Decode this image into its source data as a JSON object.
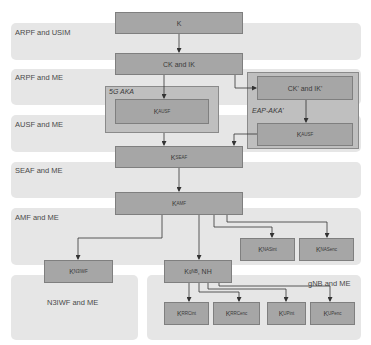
{
  "bands": [
    {
      "id": "arpf-usim",
      "label": "ARPF and USIM"
    },
    {
      "id": "arpf-me",
      "label": "ARPF and ME"
    },
    {
      "id": "ausf-me",
      "label": "AUSF and ME"
    },
    {
      "id": "seaf-me",
      "label": "SEAF and ME"
    },
    {
      "id": "amf-me",
      "label": "AMF and ME"
    },
    {
      "id": "n3iwf-me",
      "label": "N3IWF and ME"
    },
    {
      "id": "gnb-me",
      "label": "gNB and ME"
    }
  ],
  "containers": {
    "five_g_aka": {
      "label": "5G AKA"
    },
    "eap_aka_prime": {
      "label": "EAP-AKA'"
    }
  },
  "keys": {
    "k": {
      "base": "K",
      "sub": ""
    },
    "ck_ik": {
      "base": "CK and IK",
      "sub": ""
    },
    "k_ausf_5g": {
      "base": "K",
      "sub": "AUSF"
    },
    "ck_ik_prime": {
      "base": "CK' and IK'",
      "sub": ""
    },
    "k_ausf_eap": {
      "base": "K",
      "sub": "AUSF"
    },
    "k_seaf": {
      "base": "K",
      "sub": "SEAF"
    },
    "k_amf": {
      "base": "K",
      "sub": "AMF"
    },
    "k_nasint": {
      "base": "K",
      "sub": "NASint"
    },
    "k_nasenc": {
      "base": "K",
      "sub": "NASenc"
    },
    "k_n3iwf": {
      "base": "K",
      "sub": "N3IWF"
    },
    "k_gnb": {
      "base": "K",
      "sub": "gNB",
      "suffix": ", NH"
    },
    "k_rrcint": {
      "base": "K",
      "sub": "RRCint"
    },
    "k_rrcenc": {
      "base": "K",
      "sub": "RRCenc"
    },
    "k_upint": {
      "base": "K",
      "sub": "UPint"
    },
    "k_upenc": {
      "base": "K",
      "sub": "UPenc"
    }
  },
  "edges": [
    [
      "K",
      "CK and IK"
    ],
    [
      "CK and IK",
      "K_AUSF (5G AKA)"
    ],
    [
      "CK and IK",
      "CK' and IK'"
    ],
    [
      "CK' and IK'",
      "K_AUSF (EAP-AKA')"
    ],
    [
      "K_AUSF (5G AKA)",
      "K_SEAF"
    ],
    [
      "K_AUSF (EAP-AKA')",
      "K_SEAF"
    ],
    [
      "K_SEAF",
      "K_AMF"
    ],
    [
      "K_AMF",
      "K_N3IWF"
    ],
    [
      "K_AMF",
      "K_gNB, NH"
    ],
    [
      "K_AMF",
      "K_NASint"
    ],
    [
      "K_AMF",
      "K_NASenc"
    ],
    [
      "K_gNB, NH",
      "K_RRCint"
    ],
    [
      "K_gNB, NH",
      "K_RRCenc"
    ],
    [
      "K_gNB, NH",
      "K_UPint"
    ],
    [
      "K_gNB, NH",
      "K_UPenc"
    ]
  ],
  "colors": {
    "band_bg": "#e6e6e6",
    "box_fill": "#a6a6a6",
    "container_fill": "#bfbfbf",
    "line": "#333333"
  }
}
